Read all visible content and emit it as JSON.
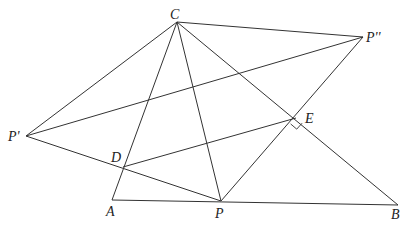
{
  "diagram": {
    "type": "geometry-figure",
    "points": {
      "C": {
        "label": "C",
        "x": 177,
        "y": 22,
        "lx": 170,
        "ly": 19
      },
      "P2": {
        "label": "P''",
        "x": 363,
        "y": 37,
        "lx": 366,
        "ly": 42
      },
      "P1": {
        "label": "P'",
        "x": 26,
        "y": 136,
        "lx": 8,
        "ly": 141
      },
      "D": {
        "label": "D",
        "x": 123,
        "y": 167,
        "lx": 111,
        "ly": 162
      },
      "E": {
        "label": "E",
        "x": 296,
        "y": 118,
        "lx": 305,
        "ly": 123
      },
      "A": {
        "label": "A",
        "x": 112,
        "y": 200,
        "lx": 106,
        "ly": 216
      },
      "P": {
        "label": "P",
        "x": 221,
        "y": 201,
        "lx": 215,
        "ly": 218
      },
      "B": {
        "label": "B",
        "x": 398,
        "y": 205,
        "lx": 391,
        "ly": 219
      }
    },
    "segments": [
      [
        "C",
        "P2"
      ],
      [
        "C",
        "P1"
      ],
      [
        "C",
        "A"
      ],
      [
        "C",
        "P"
      ],
      [
        "C",
        "B"
      ],
      [
        "P1",
        "P2"
      ],
      [
        "P1",
        "P"
      ],
      [
        "D",
        "E"
      ],
      [
        "P",
        "P2"
      ],
      [
        "A",
        "B"
      ]
    ],
    "right_angle": {
      "at": "E",
      "between": [
        "P",
        "B"
      ],
      "size": 8
    },
    "stroke_color": "#333333",
    "label_color": "#222222"
  }
}
